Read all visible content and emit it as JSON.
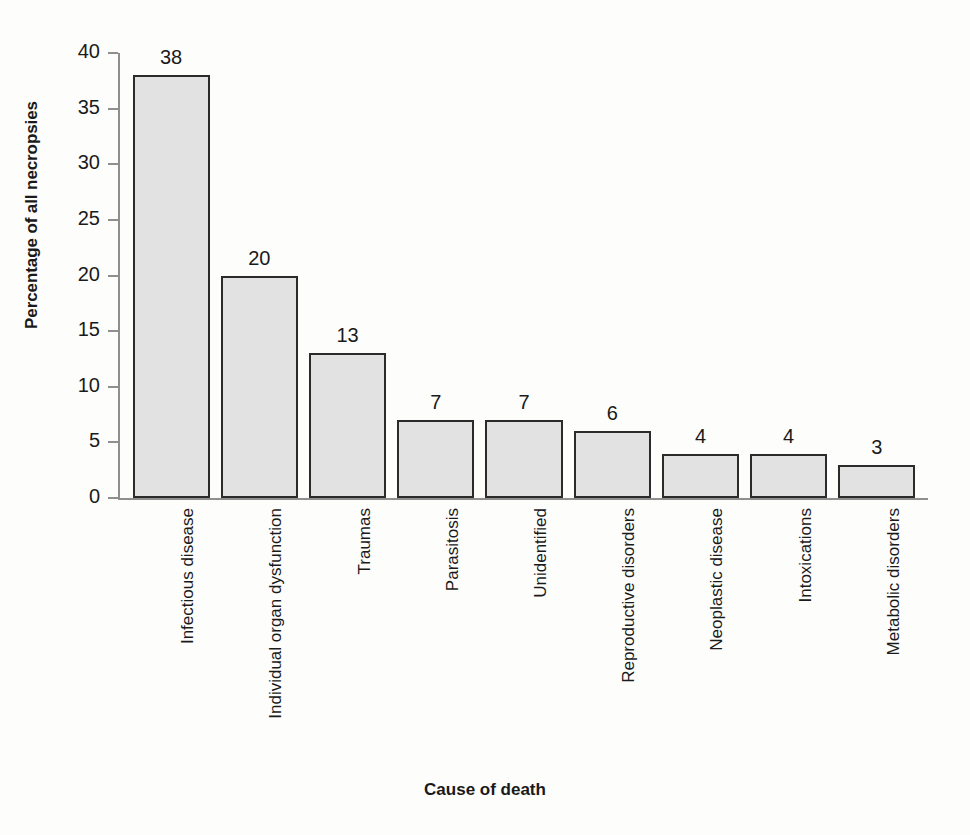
{
  "chart_data": {
    "type": "bar",
    "title": "",
    "xlabel": "Cause of death",
    "ylabel": "Percentage of all necropsies",
    "categories": [
      "Infectious disease",
      "Individual organ dysfunction",
      "Traumas",
      "Parasitosis",
      "Unidentified",
      "Reproductive disorders",
      "Neoplastic disease",
      "Intoxications",
      "Metabolic disorders"
    ],
    "values": [
      38,
      20,
      13,
      7,
      7,
      6,
      4,
      4,
      3
    ],
    "value_labels": [
      "38",
      "20",
      "13",
      "7",
      "7",
      "6",
      "4",
      "4",
      "3"
    ],
    "ylim": [
      0,
      40
    ],
    "yticks": [
      0,
      5,
      10,
      15,
      20,
      25,
      30,
      35,
      40
    ],
    "ytick_labels": [
      "0",
      "5",
      "10",
      "15",
      "20",
      "25",
      "30",
      "35",
      "40"
    ],
    "grid": false,
    "legend": null,
    "bar_fill_color": "#e2e2e2",
    "bar_border_color": "#2b2b2b",
    "axis_color": "#8f8f8f",
    "background_color": "#fdfdfc",
    "text_color": "#1a1a1a"
  }
}
